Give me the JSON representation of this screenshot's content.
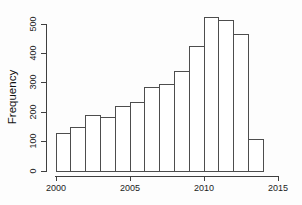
{
  "chart_data": {
    "type": "bar",
    "subtype": "histogram",
    "title": "",
    "xlabel": "",
    "ylabel": "Frequency",
    "bin_start_years": [
      2000,
      2001,
      2002,
      2003,
      2004,
      2005,
      2006,
      2007,
      2008,
      2009,
      2010,
      2011,
      2012,
      2013
    ],
    "bin_width_years": 1,
    "values": [
      130,
      150,
      190,
      185,
      220,
      235,
      285,
      295,
      340,
      425,
      525,
      515,
      465,
      110
    ],
    "x_ticks": [
      "2000",
      "2005",
      "2010",
      "2015"
    ],
    "x_tick_values": [
      2000,
      2005,
      2010,
      2015
    ],
    "y_ticks": [
      "0",
      "100",
      "200",
      "300",
      "400",
      "500"
    ],
    "y_tick_values": [
      0,
      100,
      200,
      300,
      400,
      500
    ],
    "xlim": [
      2000,
      2015
    ],
    "ylim": [
      0,
      500
    ],
    "grid": "off",
    "legend": "none",
    "bar_fill": "#ffffff",
    "bar_stroke": "#4d4d4d",
    "axis_color": "#3f3f3f",
    "text_color": "#1c1c1c",
    "background": "#fdfdfd"
  }
}
